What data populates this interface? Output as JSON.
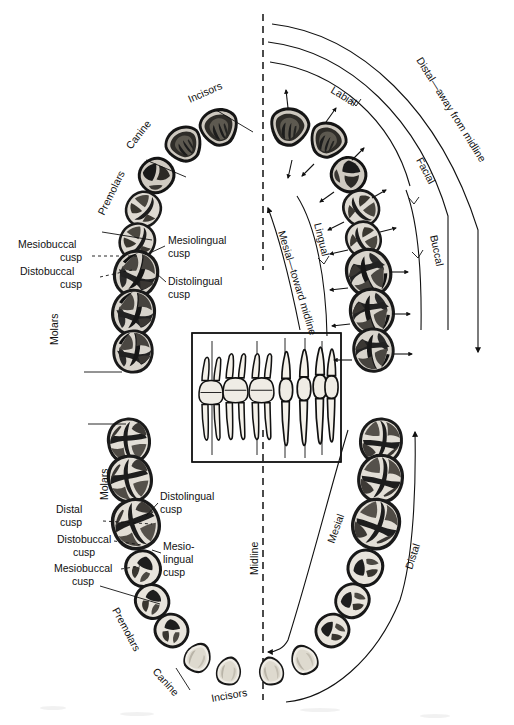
{
  "figure": {
    "midline_label": "Midline",
    "bg_color": "#ffffff",
    "ink_color": "#111111"
  },
  "directional_terms": {
    "distal_long": "Distal—away from midline",
    "mesial_long": "Mesial—toward midline",
    "facial": "Facial",
    "buccal": "Buccal",
    "labial": "Labial",
    "lingual": "Lingual",
    "mesial": "Mesial",
    "distal": "Distal"
  },
  "tooth_groups": {
    "incisors": "Incisors",
    "canine": "Canine",
    "premolars": "Premolars",
    "molars": "Molars"
  },
  "maxillary_cusps": [
    {
      "id": "mb",
      "line1": "Mesiobuccal",
      "line2": "cusp"
    },
    {
      "id": "db",
      "line1": "Distobuccal",
      "line2": "cusp"
    },
    {
      "id": "ml",
      "line1": "Mesiolingual",
      "line2": "cusp"
    },
    {
      "id": "dl",
      "line1": "Distolingual",
      "line2": "cusp"
    }
  ],
  "mandibular_cusps": [
    {
      "id": "d",
      "line1": "Distal",
      "line2": "cusp"
    },
    {
      "id": "db",
      "line1": "Distobuccal",
      "line2": "cusp"
    },
    {
      "id": "mb",
      "line1": "Mesiobuccal",
      "line2": "cusp"
    },
    {
      "id": "dl",
      "line1": "Distolingual",
      "line2": "cusp"
    },
    {
      "id": "ml",
      "line1": "Mesio-",
      "line2": "lingual",
      "line3": "cusp"
    }
  ],
  "inset": {
    "name": "lateral-tooth-profile-inset",
    "description": "Buccal/lateral view of teeth showing crowns and roots"
  },
  "arch_upper_left": {
    "label": "Maxillary left quadrant occlusal view"
  },
  "arch_upper_right": {
    "label": "Maxillary right quadrant occlusal view"
  },
  "arch_lower_left": {
    "label": "Mandibular left quadrant occlusal view"
  },
  "arch_lower_right": {
    "label": "Mandibular right quadrant occlusal view"
  }
}
